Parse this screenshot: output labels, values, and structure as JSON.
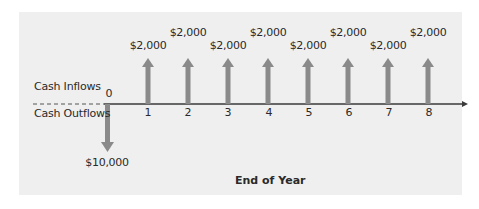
{
  "diagram": {
    "type": "cash-flow-timeline",
    "labels": {
      "inflows": "Cash Inflows",
      "outflows": "Cash Outflows",
      "x_title": "End of Year"
    },
    "outflow": {
      "year": "0",
      "amount": "$10,000"
    },
    "years": [
      "0",
      "1",
      "2",
      "3",
      "4",
      "5",
      "6",
      "7",
      "8"
    ],
    "inflows": [
      {
        "year": "1",
        "amount": "$2,000"
      },
      {
        "year": "2",
        "amount": "$2,000"
      },
      {
        "year": "3",
        "amount": "$2,000"
      },
      {
        "year": "4",
        "amount": "$2,000"
      },
      {
        "year": "5",
        "amount": "$2,000"
      },
      {
        "year": "6",
        "amount": "$2,000"
      },
      {
        "year": "7",
        "amount": "$2,000"
      },
      {
        "year": "8",
        "amount": "$2,000"
      }
    ],
    "colors": {
      "panel": "#efefef",
      "arrow": "#8a8a8a",
      "axis": "#3a3a3a"
    }
  }
}
